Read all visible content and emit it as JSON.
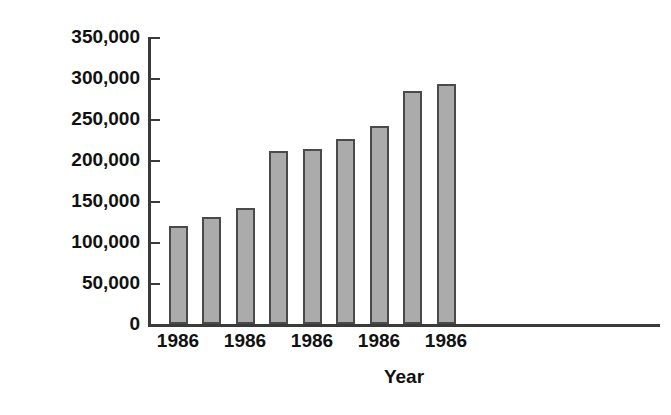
{
  "chart_data": {
    "type": "bar",
    "title": "",
    "xlabel": "Year",
    "ylabel": "Reports of elder abuse",
    "categories": [
      "1986",
      "",
      "1986",
      "",
      "1986",
      "",
      "1986",
      "",
      "1986"
    ],
    "values": [
      120000,
      130000,
      142000,
      211000,
      214000,
      226000,
      241000,
      284000,
      293000
    ],
    "ylim": [
      0,
      350000
    ],
    "y_ticks": [
      0,
      50000,
      100000,
      150000,
      200000,
      250000,
      300000,
      350000
    ],
    "y_tick_labels": [
      "0",
      "50,000",
      "100,000",
      "150,000",
      "200,000",
      "250,000",
      "300,000",
      "350,000"
    ],
    "x_tick_labels": [
      "1986",
      "1986",
      "1986",
      "1986",
      "1986"
    ],
    "x_tick_bar_indices": [
      0,
      2,
      4,
      6,
      8
    ],
    "grid": false,
    "legend": false,
    "bar_fill_color": "#ababab",
    "bar_border_color": "#4a4a4a",
    "axis_color": "#3a3a3a",
    "text_color": "#111111",
    "background_color": "#ffffff"
  }
}
